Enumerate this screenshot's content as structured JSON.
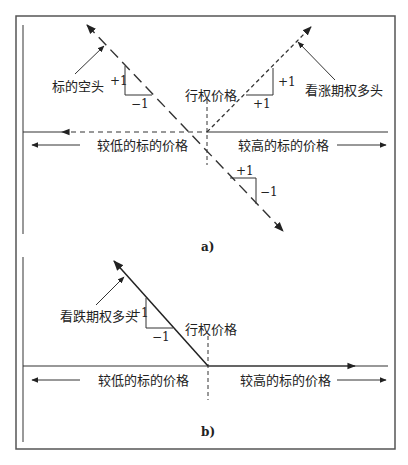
{
  "panel_a": {
    "caption": "a)",
    "short_underlying": "标的空头",
    "long_call": "看涨期权多头",
    "strike": "行权价格",
    "lower_price": "较低的标的价格",
    "higher_price": "较高的标的价格",
    "slope_left": {
      "rise": "+1",
      "run": "−1"
    },
    "slope_right": {
      "rise": "+1",
      "run": "+1"
    },
    "slope_bottom": {
      "run": "+1",
      "drop": "−1"
    }
  },
  "panel_b": {
    "caption": "b)",
    "long_put": "看跌期权多头",
    "strike": "行权价格",
    "lower_price": "较低的标的价格",
    "higher_price": "较高的标的价格",
    "slope": {
      "rise": "+1",
      "run": "−1"
    }
  },
  "colors": {
    "line": "#333333",
    "frame": "#555555"
  }
}
